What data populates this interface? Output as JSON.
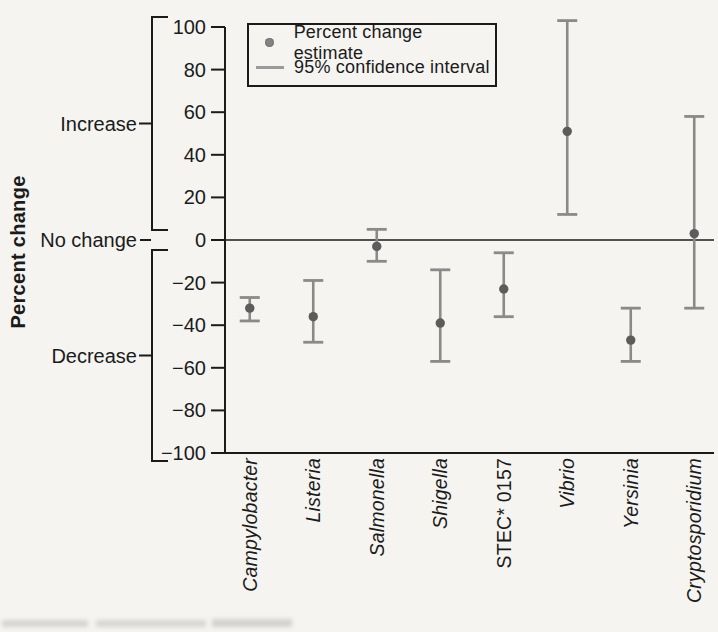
{
  "figure": {
    "background": "#f5f4f1"
  },
  "chart_data": {
    "type": "errorbar",
    "title": "",
    "xlabel": "",
    "ylabel": "Percent change",
    "ylim": [
      -100,
      100
    ],
    "grid": false,
    "legend_position": "top-left",
    "yticks": [
      {
        "v": 100,
        "label": "100"
      },
      {
        "v": 80,
        "label": "80"
      },
      {
        "v": 60,
        "label": "60"
      },
      {
        "v": 40,
        "label": "40"
      },
      {
        "v": 20,
        "label": "20"
      },
      {
        "v": 0,
        "label": "0"
      },
      {
        "v": -20,
        "label": "−20"
      },
      {
        "v": -40,
        "label": "−40"
      },
      {
        "v": -60,
        "label": "−60"
      },
      {
        "v": -80,
        "label": "−80"
      },
      {
        "v": -100,
        "label": "−100"
      }
    ],
    "zones": [
      {
        "label": "Increase"
      },
      {
        "label": "No change"
      },
      {
        "label": "Decrease"
      }
    ],
    "legend": [
      {
        "marker": "dot",
        "label": "Percent change estimate"
      },
      {
        "marker": "line",
        "label": "95% confidence interval"
      }
    ],
    "series": [
      {
        "name": "Campylobacter",
        "italic": true,
        "estimate": -32,
        "ci_low": -38,
        "ci_high": -27
      },
      {
        "name": "Listeria",
        "italic": true,
        "estimate": -36,
        "ci_low": -48,
        "ci_high": -19
      },
      {
        "name": "Salmonella",
        "italic": true,
        "estimate": -3,
        "ci_low": -10,
        "ci_high": 5
      },
      {
        "name": "Shigella",
        "italic": true,
        "estimate": -39,
        "ci_low": -57,
        "ci_high": -14
      },
      {
        "name": "STEC* 0157",
        "italic": false,
        "estimate": -23,
        "ci_low": -36,
        "ci_high": -6
      },
      {
        "name": "Vibrio",
        "italic": true,
        "estimate": 51,
        "ci_low": 12,
        "ci_high": 103
      },
      {
        "name": "Yersinia",
        "italic": true,
        "estimate": -47,
        "ci_low": -57,
        "ci_high": -32
      },
      {
        "name": "Cryptosporidium",
        "italic": true,
        "estimate": 3,
        "ci_low": -32,
        "ci_high": 58
      }
    ],
    "colors": {
      "point": "#5c5c5c",
      "interval": "#8a8a8a",
      "axis": "#1b1b1b",
      "text": "#1b1b1b"
    }
  }
}
